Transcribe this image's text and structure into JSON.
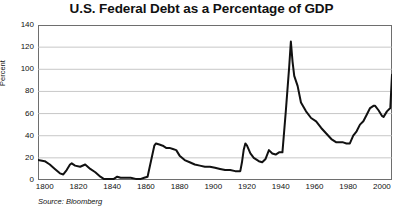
{
  "chart_data": {
    "type": "line",
    "title": "U.S. Federal Debt as a Percentage of GDP",
    "xlabel": "",
    "ylabel": "Percent",
    "source": "Source: Bloomberg",
    "xlim": [
      1796,
      2006
    ],
    "ylim": [
      0,
      140
    ],
    "ytick_step": 20,
    "yticks": [
      0,
      20,
      40,
      60,
      80,
      100,
      120,
      140
    ],
    "xticks": [
      1800,
      1820,
      1840,
      1860,
      1880,
      1900,
      1920,
      1940,
      1960,
      1980,
      2000
    ],
    "grid": "horizontal",
    "legend": "none",
    "line_color": "#111111",
    "line_width": 2.0,
    "series": [
      {
        "name": "U.S. Federal Debt as a Percentage of GDP",
        "x": [
          1796,
          1800,
          1803,
          1806,
          1809,
          1811,
          1813,
          1815,
          1816,
          1818,
          1821,
          1824,
          1827,
          1830,
          1833,
          1835,
          1838,
          1841,
          1843,
          1845,
          1848,
          1851,
          1854,
          1857,
          1859,
          1861,
          1863,
          1865,
          1866,
          1868,
          1870,
          1872,
          1874,
          1876,
          1878,
          1880,
          1883,
          1886,
          1889,
          1892,
          1895,
          1898,
          1901,
          1904,
          1907,
          1910,
          1913,
          1916,
          1917,
          1918,
          1919,
          1920,
          1922,
          1924,
          1927,
          1929,
          1931,
          1933,
          1935,
          1937,
          1939,
          1941,
          1943,
          1945,
          1946,
          1947,
          1948,
          1950,
          1952,
          1955,
          1958,
          1961,
          1964,
          1967,
          1970,
          1973,
          1975,
          1977,
          1979,
          1981,
          1983,
          1985,
          1987,
          1989,
          1991,
          1993,
          1995,
          1996,
          1998,
          2000,
          2001,
          2003,
          2005,
          2006
        ],
        "values": [
          18,
          17,
          14,
          10,
          6,
          5,
          9,
          14,
          15,
          13,
          12,
          14,
          10,
          7,
          3,
          1,
          1,
          1,
          3,
          2,
          2,
          2,
          1,
          1,
          2,
          3,
          17,
          31,
          33,
          32,
          31,
          29,
          29,
          28,
          27,
          22,
          18,
          16,
          14,
          13,
          12,
          12,
          11,
          10,
          9,
          9,
          8,
          8,
          16,
          27,
          33,
          31,
          24,
          20,
          17,
          16,
          19,
          27,
          24,
          23,
          25,
          25,
          62,
          102,
          125,
          107,
          94,
          85,
          70,
          62,
          56,
          53,
          47,
          42,
          37,
          34,
          34,
          34,
          33,
          33,
          40,
          44,
          50,
          53,
          59,
          65,
          67,
          67,
          63,
          58,
          57,
          62,
          65,
          95
        ]
      }
    ]
  }
}
